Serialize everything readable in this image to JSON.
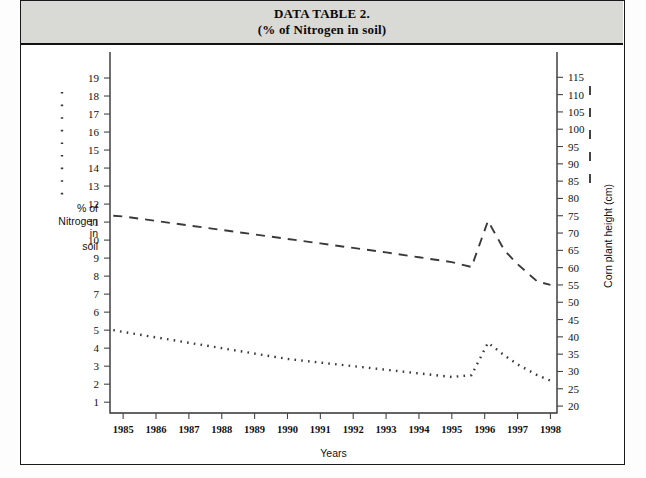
{
  "header": {
    "title_line1": "DATA TABLE 2.",
    "title_line2": "(% of Nitrogen in soil)",
    "band_color": "#d9d9d6"
  },
  "chart_data": {
    "type": "line",
    "title": "DATA TABLE 2. (% of Nitrogen in soil)",
    "xlabel": "Years",
    "ylabel": "% of Nitrogen in soil",
    "y2label": "Corn plant height (cm)",
    "grid": false,
    "legend_position": "axis-adjacent",
    "x": [
      1985,
      1986,
      1987,
      1988,
      1989,
      1990,
      1991,
      1992,
      1993,
      1994,
      1995,
      1996,
      1997,
      1998
    ],
    "xlim": [
      1984.6,
      1998.2
    ],
    "ylim": [
      0.4,
      20.0
    ],
    "yticks": [
      1,
      2,
      3,
      4,
      5,
      6,
      7,
      8,
      9,
      10,
      11,
      12,
      13,
      14,
      15,
      16,
      17,
      18,
      19
    ],
    "y2lim": [
      18.0,
      120.0
    ],
    "y2ticks": [
      20,
      25,
      30,
      35,
      40,
      45,
      50,
      55,
      60,
      65,
      70,
      75,
      80,
      85,
      90,
      95,
      100,
      105,
      110,
      115
    ],
    "series": [
      {
        "name": "Corn plant height (cm)",
        "style": "dashed",
        "axis": "right",
        "color": "#3a3a3a",
        "x": [
          1984.7,
          1985,
          1986,
          1987,
          1988,
          1989,
          1990,
          1991,
          1992,
          1993,
          1994,
          1995,
          1995.6,
          1996.1,
          1996.6,
          1997,
          1997.6,
          1998
        ],
        "values": [
          75.0,
          74.8,
          73.5,
          72.2,
          70.9,
          69.6,
          68.3,
          67.0,
          65.7,
          64.4,
          63.0,
          61.6,
          60.2,
          73.5,
          65.0,
          61.0,
          56.0,
          55.0
        ]
      },
      {
        "name": "% of Nitrogen in soil",
        "style": "dotted",
        "axis": "left",
        "color": "#3a3a3a",
        "x": [
          1984.7,
          1985,
          1986,
          1987,
          1988,
          1989,
          1990,
          1991,
          1992,
          1993,
          1994,
          1995,
          1995.6,
          1996.1,
          1996.6,
          1997,
          1997.6,
          1998
        ],
        "values": [
          5.0,
          4.9,
          4.6,
          4.3,
          4.0,
          3.7,
          3.4,
          3.2,
          3.0,
          2.8,
          2.6,
          2.4,
          2.5,
          4.3,
          3.6,
          3.1,
          2.5,
          2.2
        ]
      }
    ],
    "legend_left": {
      "label": "% of Nitrogen in soil",
      "style": "dotted"
    },
    "legend_right": {
      "label": "Corn plant height (cm)",
      "style": "dashed"
    }
  },
  "left_axis_caption": [
    "% of",
    "Nitrogen",
    "in",
    "soil"
  ],
  "right_axis_caption": "Corn plant height (cm)",
  "x_axis_caption": "Years"
}
